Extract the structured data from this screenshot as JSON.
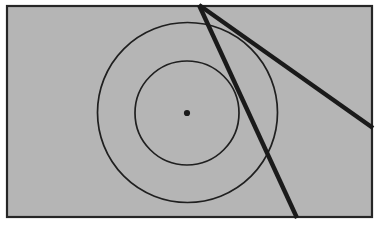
{
  "figure": {
    "title": "Two concentric circles with two thick secant lines from a common external point",
    "canvas": {
      "width": 379,
      "height": 225
    },
    "background_color": "#ffffff",
    "plot_background_color": "#b5b5b5",
    "stroke_color": "#1a1a1a",
    "border": {
      "name": "figure-border",
      "x": 7,
      "y": 6,
      "width": 365,
      "height": 211,
      "stroke_width": 2.2,
      "color": "#262626"
    },
    "center_point": {
      "label": "center",
      "cx": 187,
      "cy": 113,
      "r": 3.1,
      "color": "#1a1a1a"
    },
    "outer_circle": {
      "label": "outer-circle",
      "cx": 187.5,
      "cy": 112.5,
      "r": 90,
      "stroke_width": 1.7,
      "color": "#1f1f1f"
    },
    "inner_circle": {
      "label": "inner-circle",
      "cx": 187,
      "cy": 113,
      "r": 52,
      "stroke_width": 1.7,
      "color": "#1f1f1f"
    },
    "apex_point": {
      "label": "apex",
      "x": 199,
      "y": 5
    },
    "lines": [
      {
        "label": "steep-secant-line",
        "x1": 199,
        "y1": 5,
        "x2": 297,
        "y2": 218,
        "stroke_width": 4.4,
        "color": "#1a1a1a"
      },
      {
        "label": "shallow-secant-line",
        "x1": 199,
        "y1": 5,
        "x2": 373,
        "y2": 128,
        "stroke_width": 4.4,
        "color": "#1a1a1a"
      }
    ]
  }
}
